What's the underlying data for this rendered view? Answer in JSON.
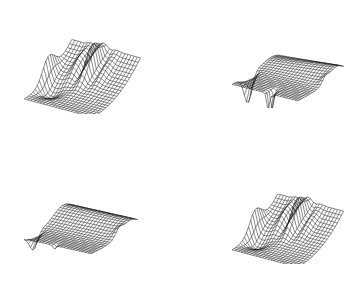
{
  "chart_data": [
    {
      "type": "surface",
      "title": "",
      "xlabel": "",
      "ylabel": "",
      "zlabel": "",
      "grid": false,
      "legend": null,
      "position": "top-left",
      "description": "3D wireframe surface with a ridge rising toward the back; tall oscillating spikes near back-center and a raised spike at left edge; flat-ish front floor",
      "features": {
        "back_ridge": "high",
        "spikes_center": "strong",
        "left_edge_spike": true,
        "front_floor": "low"
      }
    },
    {
      "type": "surface",
      "title": "",
      "xlabel": "",
      "ylabel": "",
      "zlabel": "",
      "grid": false,
      "legend": null,
      "position": "top-right",
      "description": "3D wireframe surface mostly flat plateau with a rounded bulge toward the back-right; downward spikes at left edge and front-center",
      "features": {
        "back_bulge": "moderate",
        "down_spikes": "left and front-center",
        "plateau": "flat"
      }
    },
    {
      "type": "surface",
      "title": "",
      "xlabel": "",
      "ylabel": "",
      "zlabel": "",
      "grid": false,
      "legend": null,
      "position": "bottom-left",
      "description": "3D wireframe surface with a smooth raised back section sloping toward front; small downward dip at left front corner and right edge point",
      "features": {
        "back_bulge": "moderate",
        "down_spikes": "left corner (small)",
        "plateau": "sloped"
      }
    },
    {
      "type": "surface",
      "title": "",
      "xlabel": "",
      "ylabel": "",
      "zlabel": "",
      "grid": false,
      "legend": null,
      "position": "bottom-right",
      "description": "3D wireframe surface similar to top-left: raised back wall, oscillating spikes near back-center, spike at left edge, low front floor",
      "features": {
        "back_ridge": "high",
        "spikes_center": "strong",
        "left_edge_spike": true,
        "front_floor": "low"
      }
    }
  ],
  "plots": [
    {
      "id": "tl",
      "left": 18,
      "top": 12,
      "w": 125,
      "h": 102,
      "kind": "ridge",
      "seed": 1
    },
    {
      "id": "tr",
      "left": 226,
      "top": 16,
      "w": 120,
      "h": 92,
      "kind": "plateau-down",
      "seed": 2
    },
    {
      "id": "bl",
      "left": 18,
      "top": 174,
      "w": 122,
      "h": 84,
      "kind": "plateau-soft",
      "seed": 3
    },
    {
      "id": "br",
      "left": 226,
      "top": 168,
      "w": 120,
      "h": 96,
      "kind": "ridge",
      "seed": 4
    }
  ],
  "colors": {
    "line": "#1a1a1a",
    "background": "#ffffff"
  }
}
